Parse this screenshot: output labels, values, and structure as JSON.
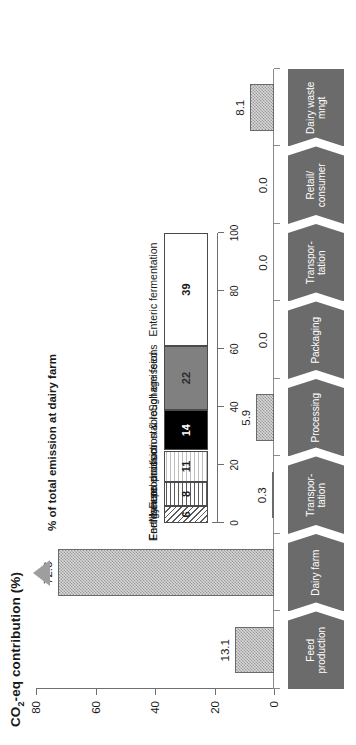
{
  "chart_data": {
    "type": "bar",
    "title": "",
    "xlabel": "",
    "ylabel": "CO2-eq contribution (%)",
    "ylim": [
      0,
      80
    ],
    "yticks": [
      "0",
      "20",
      "40",
      "60",
      "80"
    ],
    "grid": false,
    "categories": [
      "Feed production",
      "Dairy farm",
      "Transpor-\ntation",
      "Processing",
      "Packaging",
      "Transpor-\ntation",
      "Retail/\nconsumer",
      "Dairy waste\nmngt"
    ],
    "values": [
      13.1,
      72.6,
      0.3,
      5.9,
      0.0,
      0.0,
      0.0,
      8.1
    ],
    "value_labels": [
      "13.1",
      "72.6",
      "0.3",
      "5.9",
      "0.0",
      "0.0",
      "0.0",
      "8.1"
    ],
    "inset": {
      "type": "bar",
      "orientation": "stacked-horizontal",
      "title": "% of total emission at dairy farm",
      "axis_ticks": [
        "100",
        "80",
        "60",
        "40",
        "20",
        "0"
      ],
      "axis_max": 100,
      "categories": [
        "Energy use",
        "Fertiliser production",
        "Manure emission stable",
        "Feed production & roughage feed",
        "Soil emissions",
        "Enteric fermentation"
      ],
      "values": [
        6,
        8,
        11,
        14,
        22,
        39
      ],
      "value_labels": [
        "6",
        "8",
        "11",
        "14",
        "22",
        "39"
      ],
      "fills": [
        "hatch",
        "hlines",
        "grid",
        "black",
        "gray",
        "white"
      ],
      "points_to": "Dairy farm"
    }
  },
  "main_axis": {
    "label_prefix": "CO",
    "label_sub": "2",
    "label_suffix": "-eq contribution (%)"
  },
  "colors": {
    "flow_fill": "#6b6b6b",
    "flow_text": "#ffffff",
    "bar_border": "#6b6b6b",
    "bar_fill": "#d6d6d6",
    "pointer": "#9e9e9e",
    "axis": "#6f6f6f"
  },
  "icons": {
    "pointer": "triangle-pointer-icon",
    "chevron": "chevron-right-icon"
  }
}
